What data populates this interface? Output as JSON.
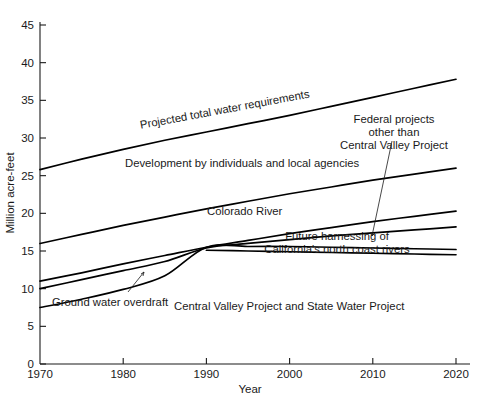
{
  "chart_data": {
    "type": "line",
    "title": "",
    "xlabel": "Year",
    "ylabel": "Million acre-feet",
    "xlim": [
      1970,
      2020
    ],
    "ylim": [
      0,
      47
    ],
    "xticks": [
      1970,
      1980,
      1990,
      2000,
      2010,
      2020
    ],
    "yticks": [
      0,
      5,
      10,
      15,
      20,
      25,
      30,
      35,
      40,
      45
    ],
    "grid": false,
    "legend": "inline-annotations",
    "x": [
      1970,
      1975,
      1980,
      1985,
      1990,
      1995,
      2000,
      2005,
      2010,
      2015,
      2020
    ],
    "series": [
      {
        "name": "Projected total water requirements",
        "values": [
          25.8,
          27.2,
          28.5,
          29.7,
          30.8,
          31.9,
          33.0,
          34.2,
          35.4,
          36.6,
          37.8
        ]
      },
      {
        "name": "Development by individuals and local agencies",
        "values": [
          16.0,
          17.2,
          18.4,
          19.5,
          20.6,
          21.6,
          22.6,
          23.5,
          24.4,
          25.2,
          26.0
        ]
      },
      {
        "name": "Colorado River",
        "values": [
          11.0,
          12.1,
          13.3,
          14.4,
          15.5,
          16.4,
          17.3,
          18.1,
          18.9,
          19.6,
          20.3
        ]
      },
      {
        "name": "Federal projects other than Central Valley Project",
        "values": [
          10.0,
          11.2,
          12.4,
          13.6,
          15.4,
          16.0,
          16.5,
          17.0,
          17.4,
          17.8,
          18.2
        ]
      },
      {
        "name": "Ground water overdraft",
        "values": [
          7.5,
          8.6,
          9.9,
          11.7,
          15.5,
          15.6,
          15.6,
          15.5,
          15.4,
          15.3,
          15.2
        ]
      },
      {
        "name": "Future harnessing of California's north coast rivers",
        "values": [
          15.5,
          15.4,
          15.3,
          15.2,
          15.1,
          15.0,
          14.9,
          14.8,
          14.7,
          14.6,
          14.5
        ],
        "x_start": 1990
      }
    ],
    "annotations": [
      {
        "id": "projected-total",
        "text": "Projected total water requirements"
      },
      {
        "id": "development-individuals",
        "text": "Development by individuals and local agencies"
      },
      {
        "id": "colorado-river",
        "text": "Colorado River"
      },
      {
        "id": "federal-projects",
        "line1": "Federal projects",
        "line2": "other than",
        "line3": "Central Valley Project"
      },
      {
        "id": "future-harnessing",
        "line1": "Future harnessing of",
        "line2": "California's north coast rivers"
      },
      {
        "id": "ground-water-overdraft",
        "text": "Ground water overdraft"
      },
      {
        "id": "central-valley-state",
        "text": "Central Valley Project and State Water Project"
      }
    ],
    "colors": {
      "line": "#000000",
      "axis": "#1a1a1a",
      "background": "#ffffff"
    }
  },
  "annotations_text": {
    "projected_total": "Projected total water requirements",
    "development": "Development by individuals and local agencies",
    "colorado": "Colorado River",
    "federal_l1": "Federal projects",
    "federal_l2": "other than",
    "federal_l3": "Central Valley Project",
    "future_l1": "Future harnessing of",
    "future_l2": "California's north coast rivers",
    "groundwater": "Ground water overdraft",
    "cvp_swp": "Central Valley Project and State Water Project"
  },
  "axes": {
    "y_title": "Million acre-feet",
    "x_title": "Year",
    "y_labels": [
      "45",
      "40",
      "35",
      "30",
      "25",
      "20",
      "15",
      "10",
      "5",
      "0"
    ],
    "x_labels": [
      "1970",
      "1980",
      "1990",
      "2000",
      "2010",
      "2020"
    ]
  }
}
